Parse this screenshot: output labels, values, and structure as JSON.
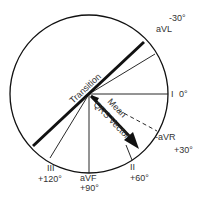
{
  "diagram": {
    "type": "hexaxial-reference-system",
    "labels": {
      "avl_angle": "-30°",
      "avl": "aVL",
      "lead_i": "I",
      "lead_i_angle": "0°",
      "neg_avr": "-aVR",
      "neg_avr_angle": "+30°",
      "lead_ii": "II",
      "lead_ii_angle": "+60°",
      "avf": "aVF",
      "avf_angle": "+90°",
      "lead_iii": "III",
      "lead_iii_angle": "+120°",
      "transition": "Transition",
      "mean": "Mean",
      "qrs_vector": "QRS Vector"
    },
    "colors": {
      "line": "#111111",
      "text": "#333333",
      "background": "#ffffff"
    }
  }
}
